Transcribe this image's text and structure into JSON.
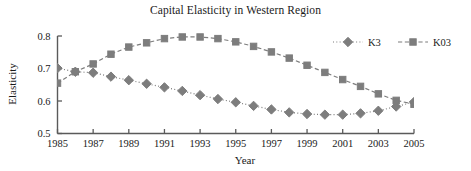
{
  "figure": {
    "width": 471,
    "height": 171,
    "background": "#ffffff"
  },
  "chart_data": {
    "type": "line",
    "title": "Capital Elasticity in Western Region",
    "xlabel": "Year",
    "ylabel": "Elasticity",
    "grid": false,
    "legend_position": "top-right",
    "xlim": [
      1985,
      2005
    ],
    "ylim": [
      0.5,
      0.8
    ],
    "x": [
      1985,
      1986,
      1987,
      1988,
      1989,
      1990,
      1991,
      1992,
      1993,
      1994,
      1995,
      1996,
      1997,
      1998,
      1999,
      2000,
      2001,
      2002,
      2003,
      2004,
      2005
    ],
    "xticks": [
      1985,
      1987,
      1989,
      1991,
      1993,
      1995,
      1997,
      1999,
      2001,
      2003,
      2005
    ],
    "xtick_labels": [
      "1985",
      "1987",
      "1989",
      "1991",
      "1993",
      "1995",
      "1997",
      "1999",
      "2001",
      "2003",
      "2005"
    ],
    "yticks": [
      0.5,
      0.6,
      0.7,
      0.8
    ],
    "ytick_labels": [
      "0.5",
      "0.6",
      "0.7",
      "0.8"
    ],
    "series": [
      {
        "name": "K3",
        "marker": "diamond",
        "linestyle": "dotted",
        "color": "#7d7d7d",
        "values": [
          0.701,
          0.69,
          0.687,
          0.675,
          0.664,
          0.653,
          0.642,
          0.631,
          0.618,
          0.606,
          0.596,
          0.585,
          0.574,
          0.565,
          0.56,
          0.558,
          0.558,
          0.562,
          0.57,
          0.583,
          0.597
        ]
      },
      {
        "name": "K03",
        "marker": "square",
        "linestyle": "dashed",
        "color": "#7d7d7d",
        "values": [
          0.655,
          0.69,
          0.714,
          0.744,
          0.766,
          0.779,
          0.792,
          0.797,
          0.797,
          0.792,
          0.782,
          0.768,
          0.751,
          0.732,
          0.71,
          0.688,
          0.666,
          0.645,
          0.622,
          0.602,
          0.59
        ]
      }
    ]
  },
  "legend": {
    "entries": [
      {
        "label": "K3"
      },
      {
        "label": "K03"
      }
    ]
  }
}
